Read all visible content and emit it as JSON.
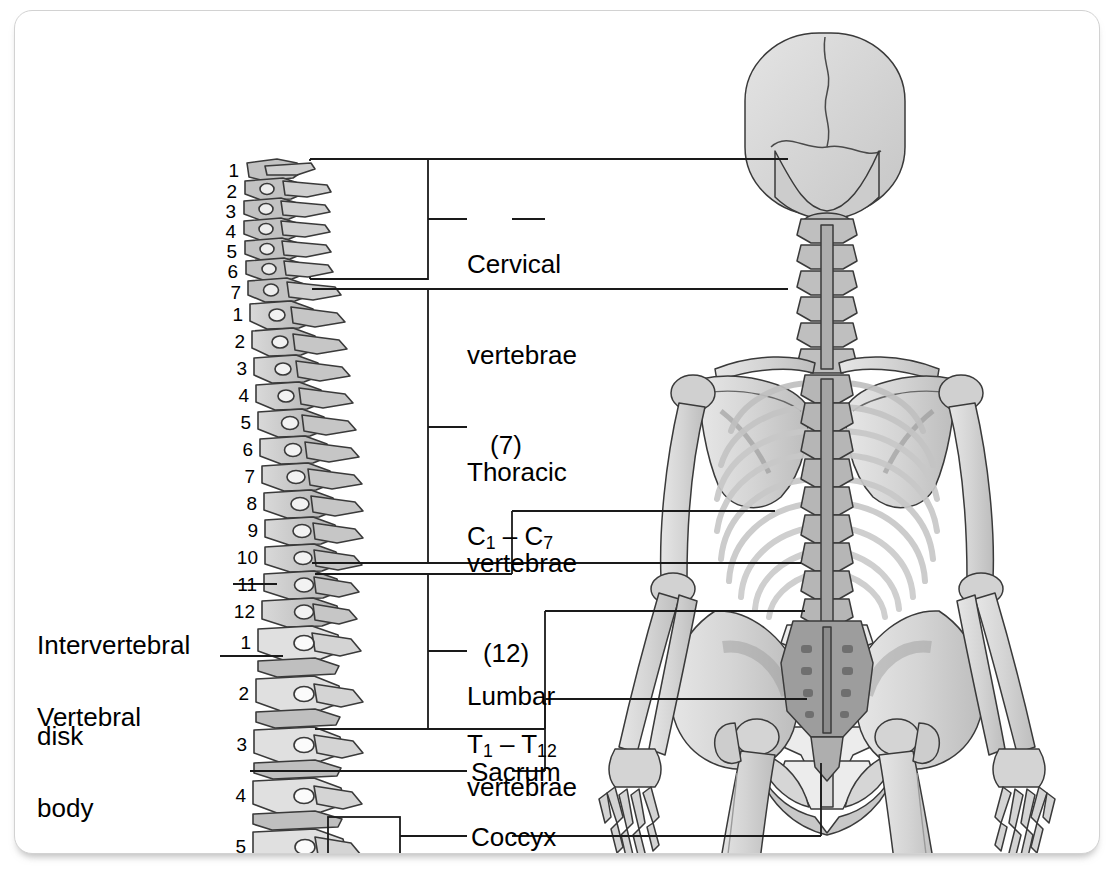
{
  "figure": {
    "background_color": "#ffffff",
    "card_border_color": "#d2d2d2",
    "line_color": "#1a1a1a",
    "bone_light": "#e2e2e2",
    "bone_mid": "#c9c9c9",
    "bone_dark": "#a8a8a8",
    "outline": "#3a3a3a"
  },
  "labels": {
    "cervical": {
      "line1": "Cervical",
      "line2": "vertebrae",
      "count": "(7)",
      "range_prefix": "C",
      "range_from": "1",
      "range_dash": " – ",
      "range_to": "7"
    },
    "thoracic": {
      "line1": "Thoracic",
      "line2": "vertebrae",
      "count": "(12)",
      "range_prefix": "T",
      "range_from": "1",
      "range_dash": " – ",
      "range_to": "12"
    },
    "lumbar": {
      "line1": "Lumbar",
      "line2": "vertebrae",
      "count": "(5)",
      "range_prefix": "L",
      "range_from": "1",
      "range_dash": " – ",
      "range_to": "5"
    },
    "sacrum": "Sacrum",
    "coccyx": "Coccyx",
    "intervertebral_disk": {
      "line1": "Intervertebral",
      "line2": "disk"
    },
    "vertebral_body": {
      "line1": "Vertebral",
      "line2": "body"
    }
  },
  "vertebra_numbers": {
    "cervical": [
      "1",
      "2",
      "3",
      "4",
      "5",
      "6",
      "7"
    ],
    "thoracic": [
      "1",
      "2",
      "3",
      "4",
      "5",
      "6",
      "7",
      "8",
      "9",
      "10",
      "11",
      "12"
    ],
    "lumbar": [
      "1",
      "2",
      "3",
      "4",
      "5"
    ]
  },
  "diagram_data": {
    "type": "anatomical-diagram",
    "view_left": "lateral vertebral column",
    "view_right": "posterior full skeleton",
    "regions": [
      {
        "name": "Cervical vertebrae",
        "count": 7,
        "range": "C1 – C7",
        "shade": "mid"
      },
      {
        "name": "Thoracic vertebrae",
        "count": 12,
        "range": "T1 – T12",
        "shade": "mid"
      },
      {
        "name": "Lumbar vertebrae",
        "count": 5,
        "range": "L1 – L5",
        "shade": "light"
      },
      {
        "name": "Sacrum",
        "count": 1,
        "range": "",
        "shade": "dark"
      },
      {
        "name": "Coccyx",
        "count": 1,
        "range": "",
        "shade": "dark"
      }
    ],
    "callouts": [
      "Intervertebral disk",
      "Vertebral body"
    ]
  }
}
